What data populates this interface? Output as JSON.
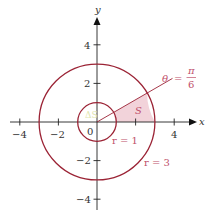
{
  "diagram": {
    "type": "polar-region",
    "axes": {
      "x_label": "x",
      "y_label": "y",
      "origin_label": "0",
      "x_ticks": [
        {
          "value": -4,
          "label": "−4"
        },
        {
          "value": -2,
          "label": "−2"
        },
        {
          "value": 2,
          "label": ""
        },
        {
          "value": 4,
          "label": "4"
        }
      ],
      "y_ticks": [
        {
          "value": 4,
          "label": "4"
        },
        {
          "value": 2,
          "label": "2"
        },
        {
          "value": -2,
          "label": "−2"
        },
        {
          "value": -4,
          "label": "−4"
        }
      ]
    },
    "circles": [
      {
        "radius": 1,
        "label": "r = 1"
      },
      {
        "radius": 3,
        "label": "r = 3"
      }
    ],
    "ray": {
      "theta_label": "θ",
      "equals": "=",
      "numerator": "π",
      "denominator": "6"
    },
    "region": {
      "label": "S",
      "faint_label": "ΔS"
    },
    "colors": {
      "curve": "#9b2335",
      "annotation": "#c0506a",
      "region_fill": "#f2d3da",
      "axis": "#222222",
      "faint": "#dfe6b0"
    }
  }
}
